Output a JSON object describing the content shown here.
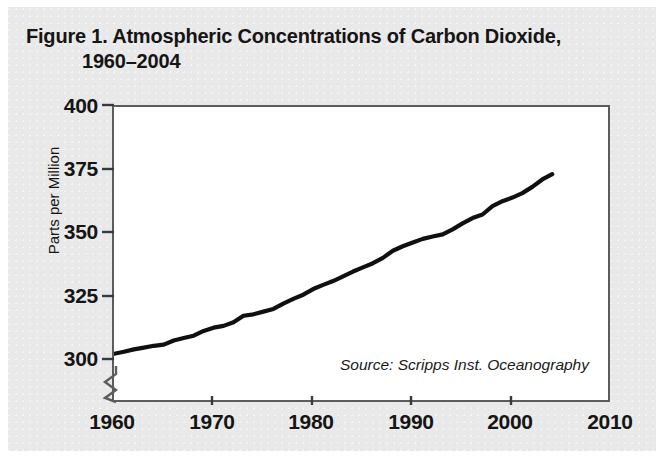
{
  "figure": {
    "title_line_1": "Figure 1. Atmospheric Concentrations of Carbon Dioxide,",
    "title_line_2": "1960–2004",
    "source_note": "Source: Scripps Inst. Oceanography",
    "panel_color": "#e9e9e9",
    "line_color": "#101010",
    "axis_color": "#5c5c5c"
  },
  "chart_data": {
    "type": "line",
    "title": "Figure 1. Atmospheric Concentrations of Carbon Dioxide, 1960–2004",
    "xlabel": "",
    "ylabel": "Parts per Million",
    "xlim": [
      1960,
      2010
    ],
    "ylim": [
      300,
      400
    ],
    "y_axis_break": true,
    "grid": false,
    "legend": null,
    "annotations": [
      "Source: Scripps Inst. Oceanography"
    ],
    "xticks": [
      1960,
      1970,
      1980,
      1990,
      2000,
      2010
    ],
    "xtick_labels": [
      "1960",
      "1970",
      "1980",
      "1990",
      "2000",
      "2010"
    ],
    "yticks": [
      300,
      325,
      350,
      375,
      400
    ],
    "ytick_labels": [
      "300",
      "325",
      "350",
      "375",
      "400"
    ],
    "series": [
      {
        "name": "Atmospheric CO2 concentration (Mauna Loa)",
        "x": [
          1960,
          1961,
          1962,
          1963,
          1964,
          1965,
          1966,
          1967,
          1968,
          1969,
          1970,
          1971,
          1972,
          1973,
          1974,
          1975,
          1976,
          1977,
          1978,
          1979,
          1980,
          1981,
          1982,
          1983,
          1984,
          1985,
          1986,
          1987,
          1988,
          1989,
          1990,
          1991,
          1992,
          1993,
          1994,
          1995,
          1996,
          1997,
          1998,
          1999,
          2000,
          2001,
          2002,
          2003,
          2004
        ],
        "values": [
          316.9,
          317.6,
          318.4,
          319.0,
          319.6,
          320.0,
          321.4,
          322.2,
          323.0,
          324.6,
          325.7,
          326.3,
          327.5,
          329.7,
          330.2,
          331.1,
          332.0,
          333.8,
          335.4,
          336.8,
          338.7,
          340.1,
          341.4,
          343.0,
          344.6,
          346.0,
          347.4,
          349.2,
          351.6,
          353.1,
          354.4,
          355.6,
          356.4,
          357.1,
          358.8,
          360.8,
          362.6,
          363.8,
          366.6,
          368.3,
          369.5,
          371.0,
          373.1,
          375.6,
          377.4
        ]
      }
    ]
  },
  "axes": {
    "y_title": "Parts per Million"
  }
}
